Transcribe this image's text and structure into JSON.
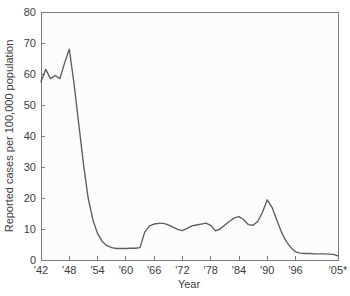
{
  "chart_data": {
    "type": "line",
    "title": "",
    "xlabel": "Year",
    "ylabel": "Reported cases per 100,000 population",
    "xlim": [
      1942,
      2005
    ],
    "ylim": [
      0,
      80
    ],
    "grid": false,
    "legend": "none",
    "x_tick_labels": [
      "'42",
      "'48",
      "'54",
      "'60",
      "'66",
      "'72",
      "'78",
      "'84",
      "'90",
      "'96",
      "'05*"
    ],
    "x_tick_values": [
      1942,
      1948,
      1954,
      1960,
      1966,
      1972,
      1978,
      1984,
      1990,
      1996,
      2005
    ],
    "y_tick_labels": [
      "0",
      "10",
      "20",
      "30",
      "40",
      "50",
      "60",
      "70",
      "80"
    ],
    "y_tick_values": [
      0,
      10,
      20,
      30,
      40,
      50,
      60,
      70,
      80
    ],
    "series": [
      {
        "name": "Reported cases per 100,000 population",
        "color": "#5e5e5e",
        "x": [
          1942,
          1943,
          1944,
          1945,
          1946,
          1947,
          1948,
          1949,
          1950,
          1951,
          1952,
          1953,
          1954,
          1955,
          1956,
          1957,
          1958,
          1959,
          1960,
          1961,
          1962,
          1963,
          1964,
          1965,
          1966,
          1967,
          1968,
          1969,
          1970,
          1971,
          1972,
          1973,
          1974,
          1975,
          1976,
          1977,
          1978,
          1979,
          1980,
          1981,
          1982,
          1983,
          1984,
          1985,
          1986,
          1987,
          1988,
          1989,
          1990,
          1991,
          1992,
          1993,
          1994,
          1995,
          1996,
          1997,
          1998,
          1999,
          2000,
          2001,
          2002,
          2003,
          2004,
          2005
        ],
        "y": [
          57.5,
          61.5,
          58.5,
          59.5,
          58.5,
          63.5,
          68.0,
          57.0,
          44.0,
          31.0,
          20.0,
          13.0,
          8.5,
          6.0,
          4.6,
          4.0,
          3.7,
          3.7,
          3.7,
          3.8,
          3.8,
          4.0,
          9.0,
          11.0,
          11.6,
          11.8,
          11.8,
          11.3,
          10.6,
          9.9,
          9.5,
          10.2,
          11.0,
          11.3,
          11.6,
          11.9,
          11.2,
          9.4,
          10.0,
          11.3,
          12.5,
          13.6,
          14.0,
          13.0,
          11.4,
          11.2,
          12.5,
          15.5,
          19.4,
          17.0,
          13.0,
          9.0,
          6.0,
          4.0,
          2.6,
          2.2,
          2.1,
          2.1,
          2.0,
          2.0,
          2.0,
          1.9,
          1.8,
          1.3
        ]
      }
    ]
  },
  "axes": {
    "x_title": "Year",
    "y_title": "Reported cases per 100,000 population"
  }
}
